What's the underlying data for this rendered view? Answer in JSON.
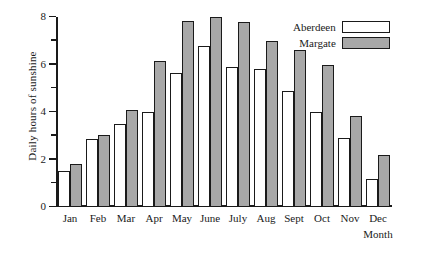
{
  "chart_data": {
    "type": "bar",
    "title": "",
    "xlabel": "Month",
    "ylabel": "Daily hours of sunshine",
    "categories": [
      "Jan",
      "Feb",
      "Mar",
      "Apr",
      "May",
      "June",
      "July",
      "Aug",
      "Sept",
      "Oct",
      "Nov",
      "Dec"
    ],
    "series": [
      {
        "name": "Aberdeen",
        "color": "#ffffff",
        "values": [
          1.5,
          2.85,
          3.5,
          4.0,
          5.65,
          6.8,
          5.9,
          5.8,
          4.9,
          4.0,
          2.9,
          1.2
        ]
      },
      {
        "name": "Margate",
        "color": "#a8a8a8",
        "values": [
          1.8,
          3.05,
          4.1,
          6.15,
          7.85,
          8.0,
          7.8,
          7.0,
          6.6,
          6.0,
          3.85,
          2.2
        ]
      }
    ],
    "ylim": [
      0,
      8
    ],
    "ytick_major": [
      0,
      2,
      4,
      6,
      8
    ],
    "ytick_major_labels": [
      "0",
      "2",
      "4",
      "6",
      "8"
    ],
    "ytick_minor": [
      1,
      3,
      5,
      7
    ],
    "grid": false,
    "legend_position": "top-right"
  },
  "legend": {
    "entries": [
      {
        "label": "Aberdeen"
      },
      {
        "label": "Margate"
      }
    ]
  },
  "axes": {
    "y_title": "Daily hours of sunshine",
    "x_title": "Month"
  }
}
